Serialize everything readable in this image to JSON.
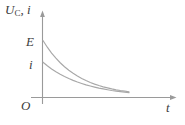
{
  "figure": {
    "title": "",
    "background_color": "#ffffff",
    "line_color": "#a8a8a8",
    "axis_color": "#9a9a9a",
    "text_color": "#3c3c3c"
  },
  "labels": {
    "y_axis_main": "U",
    "y_axis_sub": "C",
    "y_axis_comma": ",",
    "y_axis_second": "i",
    "value_E": "E",
    "value_i": "i",
    "origin": "O",
    "x_axis": "t"
  },
  "chart_data": {
    "type": "line",
    "title": "",
    "xlabel": "t",
    "ylabel": "U_C, i",
    "xlim": [
      0,
      1
    ],
    "ylim": [
      0,
      1
    ],
    "grid": false,
    "legend": "none",
    "annotations": [
      {
        "text": "E",
        "x": 0,
        "y": 0.62,
        "note": "initial capacitor voltage on y-axis"
      },
      {
        "text": "i",
        "x": 0,
        "y": 0.38,
        "note": "initial current on y-axis"
      },
      {
        "text": "O",
        "x": 0,
        "y": 0,
        "note": "origin"
      },
      {
        "text": "t",
        "x": 1,
        "y": 0,
        "note": "time axis arrow label"
      }
    ],
    "series": [
      {
        "name": "U_C",
        "start_value": 0.62,
        "decay": "exponential",
        "x": [
          0.0,
          0.05,
          0.1,
          0.15,
          0.2,
          0.25,
          0.3,
          0.35,
          0.4,
          0.45,
          0.5,
          0.55,
          0.6,
          0.65,
          0.7,
          0.75,
          0.8,
          0.85,
          0.9,
          0.95,
          1.0
        ],
        "values": [
          0.62,
          0.546,
          0.481,
          0.424,
          0.374,
          0.33,
          0.291,
          0.257,
          0.227,
          0.2,
          0.177,
          0.156,
          0.138,
          0.122,
          0.108,
          0.096,
          0.085,
          0.075,
          0.067,
          0.06,
          0.053
        ]
      },
      {
        "name": "i",
        "start_value": 0.38,
        "decay": "exponential",
        "x": [
          0.0,
          0.05,
          0.1,
          0.15,
          0.2,
          0.25,
          0.3,
          0.35,
          0.4,
          0.45,
          0.5,
          0.55,
          0.6,
          0.65,
          0.7,
          0.75,
          0.8,
          0.85,
          0.9,
          0.95,
          1.0
        ],
        "values": [
          0.38,
          0.341,
          0.306,
          0.275,
          0.247,
          0.222,
          0.199,
          0.179,
          0.161,
          0.145,
          0.13,
          0.117,
          0.105,
          0.094,
          0.085,
          0.076,
          0.068,
          0.061,
          0.055,
          0.049,
          0.044
        ]
      }
    ]
  }
}
